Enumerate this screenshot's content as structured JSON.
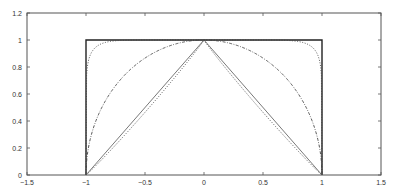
{
  "chart_data": {
    "type": "line",
    "title": "",
    "xlabel": "",
    "ylabel": "",
    "xlim": [
      -1.5,
      1.5
    ],
    "ylim": [
      0,
      1.2
    ],
    "grid": false,
    "legend": null,
    "xticks": [
      -1.5,
      -1,
      -0.5,
      0,
      0.5,
      1,
      1.5
    ],
    "xtick_labels": [
      "-1.5",
      "-1",
      "-0.5",
      "0",
      "0.5",
      "1",
      "1.5"
    ],
    "yticks": [
      0,
      0.2,
      0.4,
      0.6,
      0.8,
      1,
      1.2
    ],
    "ytick_labels": [
      "0",
      "0.2",
      "0.4",
      "0.6",
      "0.8",
      "1",
      "1.2"
    ],
    "series": [
      {
        "name": "p = infinity (box)",
        "p": "inf",
        "style": "solid",
        "color": "#222222",
        "width": 1.4,
        "x": [
          -1,
          -1,
          1,
          1
        ],
        "y": [
          0,
          1,
          1,
          0
        ]
      },
      {
        "name": "p = 10",
        "p": 10,
        "style": "dotted",
        "color": "#444444",
        "width": 0.9
      },
      {
        "name": "p = 2 (circle)",
        "p": 2,
        "style": "dashdot",
        "color": "#444444",
        "width": 0.9
      },
      {
        "name": "p = 1 (linear)",
        "p": 1,
        "style": "solid",
        "color": "#555555",
        "width": 0.8,
        "x": [
          -1,
          0,
          1
        ],
        "y": [
          0,
          1,
          0
        ]
      },
      {
        "name": "p = 0.95",
        "p": 0.95,
        "style": "dotted",
        "color": "#444444",
        "width": 0.9
      }
    ]
  },
  "plot_area": {
    "left": 27,
    "top": 13,
    "right": 381,
    "bottom": 175
  }
}
